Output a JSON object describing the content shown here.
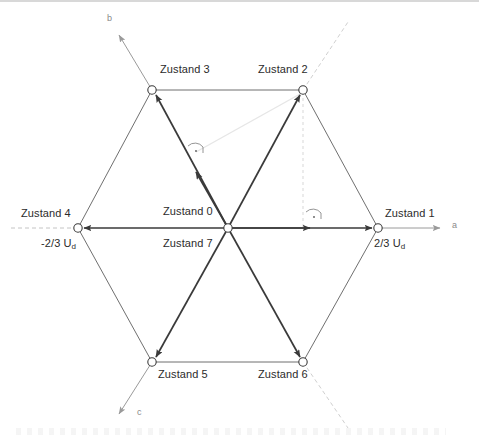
{
  "diagram": {
    "type": "space-vector-hexagon",
    "colors": {
      "vector_stroke": "#3a3a3a",
      "hexagon_stroke": "#595959",
      "axis_stroke": "#8c8c8c",
      "dashed_stroke": "#b9b9b9",
      "faint_stroke": "#e2e2e2",
      "text": "#2b2b2b",
      "axis_text": "#8a8a8a",
      "node_fill": "#ffffff"
    },
    "origin": {
      "label_top": "Zustand 0",
      "label_bottom": "Zustand 7",
      "x": 228,
      "y": 228
    },
    "vertices": [
      {
        "id": "z1",
        "label": "Zustand 1",
        "angle_deg": 0,
        "x": 378,
        "y": 228,
        "magnitude_label": "2/3 U",
        "magnitude_sub": "d"
      },
      {
        "id": "z2",
        "label": "Zustand 2",
        "angle_deg": 60,
        "x": 303,
        "y": 90,
        "magnitude_label": "",
        "magnitude_sub": ""
      },
      {
        "id": "z3",
        "label": "Zustand 3",
        "angle_deg": 120,
        "x": 152,
        "y": 90,
        "magnitude_label": "",
        "magnitude_sub": ""
      },
      {
        "id": "z4",
        "label": "Zustand 4",
        "angle_deg": 180,
        "x": 78,
        "y": 228,
        "magnitude_label": "-2/3 U",
        "magnitude_sub": "d"
      },
      {
        "id": "z5",
        "label": "Zustand 5",
        "angle_deg": 240,
        "x": 152,
        "y": 362,
        "magnitude_label": "",
        "magnitude_sub": ""
      },
      {
        "id": "z6",
        "label": "Zustand 6",
        "angle_deg": 300,
        "x": 303,
        "y": 362,
        "magnitude_label": "",
        "magnitude_sub": ""
      }
    ],
    "axes": [
      {
        "id": "a",
        "label": "a",
        "angle_deg": 0,
        "x": 455,
        "y": 225
      },
      {
        "id": "b",
        "label": "b",
        "angle_deg": 120,
        "x": 108,
        "y": 17
      },
      {
        "id": "c",
        "label": "c",
        "angle_deg": 240,
        "x": 138,
        "y": 411
      }
    ],
    "angle_markers": [
      {
        "id": "marker-z3-vector",
        "x": 196,
        "y": 150
      },
      {
        "id": "marker-a-axis",
        "x": 314,
        "y": 216
      }
    ]
  }
}
